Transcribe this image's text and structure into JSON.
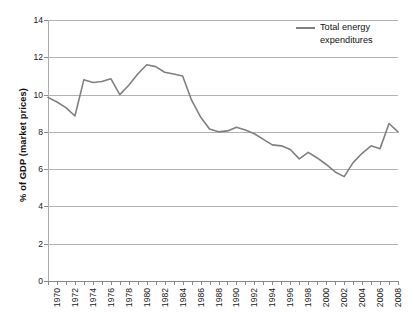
{
  "chart_data": {
    "type": "line",
    "title": "",
    "xlabel": "",
    "ylabel": "% of GDP (market prices)",
    "ylim": [
      0,
      14
    ],
    "xlim": [
      1970,
      2009
    ],
    "y_ticks": [
      0,
      2,
      4,
      6,
      8,
      10,
      12,
      14
    ],
    "x_ticks": [
      1970,
      1972,
      1974,
      1976,
      1978,
      1980,
      1982,
      1984,
      1986,
      1988,
      1990,
      1992,
      1994,
      1996,
      1998,
      2000,
      2002,
      2004,
      2006,
      2008
    ],
    "x_tick_labels": [
      "1970",
      "1972",
      "1974",
      "1976",
      "1978",
      "1980",
      "1982",
      "1984",
      "1986",
      "1988",
      "1990",
      "1992",
      "1994",
      "1996",
      "1998",
      "2000",
      "2002",
      "2004",
      "2006",
      "2008"
    ],
    "y_tick_labels": [
      "0",
      "2",
      "4",
      "6",
      "8",
      "10",
      "12",
      "14"
    ],
    "grid": "horizontal",
    "legend_position": "top-right",
    "x": [
      1970,
      1971,
      1972,
      1973,
      1974,
      1975,
      1976,
      1977,
      1978,
      1979,
      1980,
      1981,
      1982,
      1983,
      1984,
      1985,
      1986,
      1987,
      1988,
      1989,
      1990,
      1991,
      1992,
      1993,
      1994,
      1995,
      1996,
      1997,
      1998,
      1999,
      2000,
      2001,
      2002,
      2003,
      2004,
      2005,
      2006,
      2007,
      2008,
      2009
    ],
    "series": [
      {
        "name": "Total energy expenditures",
        "legend_label_line1": "Total energy",
        "legend_label_line2": "expenditures",
        "color": "#808080",
        "values": [
          9.85,
          9.6,
          9.3,
          8.85,
          10.8,
          10.65,
          10.7,
          10.85,
          10.0,
          10.5,
          11.1,
          11.6,
          11.5,
          11.2,
          11.1,
          11.0,
          9.7,
          8.8,
          8.15,
          8.0,
          8.05,
          8.25,
          8.1,
          7.9,
          7.6,
          7.3,
          7.25,
          7.05,
          6.55,
          6.9,
          6.6,
          6.25,
          5.85,
          5.6,
          6.35,
          6.85,
          7.25,
          7.1,
          8.45,
          8.0
        ]
      }
    ]
  },
  "legend": {
    "swatch_color": "#808080"
  }
}
